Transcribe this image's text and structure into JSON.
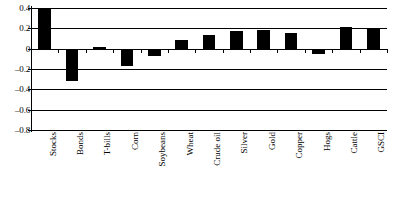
{
  "chart_data": {
    "type": "bar",
    "title": "",
    "subtitle": "",
    "xlabel": "",
    "ylabel": "",
    "categories": [
      "Stocks",
      "Bonds",
      "T-bills",
      "Corn",
      "Soybeans",
      "Wheat",
      "Crude oil",
      "Silver",
      "Gold",
      "Copper",
      "Hogs",
      "Cattle",
      "GSCI"
    ],
    "values": [
      0.4,
      -0.32,
      0.02,
      -0.17,
      -0.07,
      0.09,
      0.13,
      0.17,
      0.18,
      0.15,
      -0.05,
      0.21,
      0.19
    ],
    "ylim": [
      -0.8,
      0.4
    ],
    "ytick_values": [
      0.4,
      0.2,
      0.0,
      -0.2,
      -0.4,
      -0.6,
      -0.8
    ],
    "ytick_labels": [
      "0.4",
      "0.2",
      "0",
      "–0.2",
      "–0.4",
      "–0.6",
      "–0.8"
    ],
    "grid": true,
    "grid_axis": "y",
    "legend": false,
    "legend_position": "none",
    "bar_color": "#000000",
    "axis_color": "#000000",
    "background_color": "#ffffff",
    "annotations": []
  }
}
